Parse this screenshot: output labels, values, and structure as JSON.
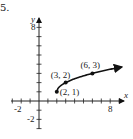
{
  "problem_number": "5.",
  "chart_data": {
    "type": "line",
    "title": "",
    "function": "y = sqrt(x - 2) + 1",
    "xlabel": "x",
    "ylabel": "y",
    "xlim": [
      -3,
      9.5
    ],
    "ylim": [
      -3,
      9
    ],
    "x_tick_labels": [
      "-2",
      "8"
    ],
    "y_tick_labels": [
      "8",
      "-2"
    ],
    "grid": false,
    "legend": null,
    "points": [
      {
        "x": 2,
        "y": 1,
        "label": "(2, 1)"
      },
      {
        "x": 3,
        "y": 2,
        "label": "(3, 2)"
      },
      {
        "x": 6,
        "y": 3,
        "label": "(6, 3)"
      }
    ],
    "curve": {
      "start": {
        "x": 2,
        "y": 1
      },
      "end_arrow": true,
      "x": [
        2,
        2.25,
        2.5,
        3,
        4,
        5,
        6,
        7,
        8,
        9.3
      ],
      "y": [
        1,
        1.5,
        1.71,
        2,
        2.41,
        2.73,
        3,
        3.24,
        3.45,
        3.7
      ]
    }
  }
}
